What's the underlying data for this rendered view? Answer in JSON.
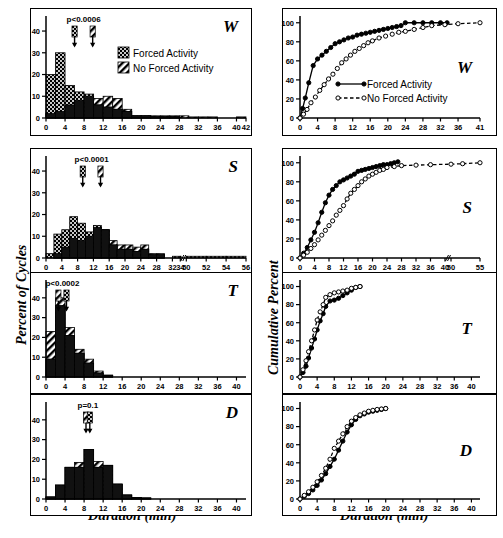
{
  "figure": {
    "xlabel": "Duration (min)",
    "ylabel_left": "Percent of Cycles",
    "ylabel_right": "Cumulative Percent",
    "legend_hist": [
      {
        "key": "forced",
        "label": "Forced Activity",
        "pattern": "checker-dark"
      },
      {
        "key": "no_forced",
        "label": "No Forced Activity",
        "pattern": "hatch-diagonal"
      }
    ],
    "legend_cumulative": [
      {
        "key": "forced",
        "label": "Forced Activity",
        "marker": "filled-circle",
        "line": "solid"
      },
      {
        "key": "no_forced",
        "label": "No Forced Activity",
        "marker": "open-circle",
        "line": "dashed"
      }
    ]
  },
  "chart_data": [
    {
      "id": "hist-W",
      "type": "bar",
      "panel_letter": "W",
      "title": "",
      "xlabel": "Duration (min)",
      "ylabel": "Percent of Cycles",
      "annotation": "p<0.0006",
      "arrows": [
        {
          "series": "forced",
          "x": 6.0
        },
        {
          "series": "no_forced",
          "x": 9.8
        }
      ],
      "xlim": [
        0,
        42
      ],
      "ylim": [
        0,
        46
      ],
      "xticks": [
        0,
        4,
        8,
        12,
        16,
        20,
        24,
        28,
        32,
        36,
        40,
        42
      ],
      "yticks": [
        0,
        10,
        20,
        30,
        40
      ],
      "bin_width": 2,
      "bin_starts": [
        0,
        2,
        4,
        6,
        8,
        10,
        12,
        14,
        16,
        18,
        20,
        22,
        24,
        26,
        28,
        30,
        32,
        34,
        36,
        38,
        40
      ],
      "series": [
        {
          "name": "Forced Activity",
          "values": [
            20,
            30,
            15,
            12,
            11,
            6,
            5,
            4,
            3,
            1,
            1,
            0.6,
            0.6,
            0.6,
            0,
            0,
            0,
            0,
            0,
            0,
            0
          ]
        },
        {
          "name": "No Forced Activity",
          "values": [
            2,
            3,
            6,
            8,
            10,
            9,
            10,
            9,
            4,
            1,
            1,
            1,
            1,
            1,
            1,
            0.5,
            0.5,
            0.5,
            0,
            0,
            0.5
          ]
        }
      ]
    },
    {
      "id": "hist-S",
      "type": "bar",
      "panel_letter": "S",
      "xlabel": "Duration (min)",
      "ylabel": "Percent of Cycles",
      "annotation": "p<0.0001",
      "arrows": [
        {
          "series": "forced",
          "x": 9.3
        },
        {
          "series": "no_forced",
          "x": 13.8
        }
      ],
      "xlim": [
        0,
        56
      ],
      "ylim": [
        0,
        46
      ],
      "xticks": [
        0,
        4,
        8,
        12,
        16,
        20,
        24,
        28,
        32,
        34,
        50,
        52,
        54,
        56
      ],
      "axis_break_after": 34,
      "yticks": [
        0,
        10,
        20,
        30,
        40
      ],
      "bin_width": 2,
      "bin_starts": [
        0,
        2,
        4,
        6,
        8,
        10,
        12,
        14,
        16,
        18,
        20,
        22,
        24,
        26,
        28,
        30,
        32,
        34,
        50,
        52,
        54
      ],
      "series": [
        {
          "name": "Forced Activity",
          "values": [
            2,
            11,
            13,
            19,
            16,
            12,
            15,
            13,
            6,
            4,
            4,
            3,
            4,
            1.5,
            1.5,
            0,
            0.8,
            0.8,
            0.8,
            0.8,
            0.8
          ]
        },
        {
          "name": "No Forced Activity",
          "values": [
            0,
            2,
            5,
            9,
            8,
            10,
            14,
            13,
            8,
            6,
            6,
            5,
            6,
            2,
            2,
            0,
            0,
            0,
            0,
            0,
            0
          ]
        }
      ]
    },
    {
      "id": "hist-T",
      "type": "bar",
      "panel_letter": "T",
      "xlabel": "Duration (min)",
      "ylabel": "Percent of Cycles",
      "annotation": "p<0.0002",
      "arrows": [
        {
          "series": "no_forced",
          "x": 2.6
        },
        {
          "series": "forced",
          "x": 4.3
        }
      ],
      "xlim": [
        0,
        42
      ],
      "ylim": [
        0,
        48
      ],
      "xticks": [
        0,
        4,
        8,
        12,
        16,
        20,
        24,
        28,
        32,
        36,
        40
      ],
      "yticks": [
        0,
        10,
        20,
        30,
        40
      ],
      "bin_width": 2,
      "bin_starts": [
        0,
        2,
        4,
        6,
        8,
        10,
        12,
        14,
        16,
        18,
        20
      ],
      "series": [
        {
          "name": "Forced Activity",
          "values": [
            9,
            36,
            21,
            12,
            7,
            2,
            0.8,
            0,
            0,
            0,
            0
          ]
        },
        {
          "name": "No Forced Activity",
          "values": [
            23,
            40,
            25,
            14,
            9,
            3,
            1,
            0,
            0,
            0,
            0
          ]
        }
      ]
    },
    {
      "id": "hist-D",
      "type": "bar",
      "panel_letter": "D",
      "xlabel": "Duration (min)",
      "ylabel": "Percent of Cycles",
      "annotation": "p=0.1",
      "arrows": [
        {
          "series": "no_forced",
          "x": 8.4
        },
        {
          "series": "forced",
          "x": 9.2
        }
      ],
      "xlim": [
        0,
        42
      ],
      "ylim": [
        0,
        48
      ],
      "xticks": [
        0,
        4,
        8,
        12,
        16,
        20,
        24,
        28,
        32,
        36,
        40
      ],
      "yticks": [
        0,
        10,
        20,
        30,
        40
      ],
      "bin_width": 2,
      "bin_starts": [
        0,
        2,
        4,
        6,
        8,
        10,
        12,
        14,
        16,
        18,
        20,
        22
      ],
      "series": [
        {
          "name": "Forced Activity",
          "values": [
            1,
            7,
            16,
            16,
            25,
            16,
            17,
            7.5,
            2,
            0.8,
            0.5,
            0
          ]
        },
        {
          "name": "No Forced Activity",
          "values": [
            1,
            7,
            16,
            18.5,
            25,
            19,
            17,
            7.5,
            2,
            0.8,
            0.5,
            0
          ]
        }
      ]
    },
    {
      "id": "cum-W",
      "type": "line",
      "panel_letter": "W",
      "xlabel": "Duration (min)",
      "ylabel": "Cumulative Percent",
      "xlim": [
        0,
        41
      ],
      "ylim": [
        0,
        105
      ],
      "xticks": [
        0,
        4,
        8,
        12,
        16,
        20,
        24,
        28,
        32,
        36,
        41
      ],
      "yticks": [
        0,
        20,
        40,
        60,
        80,
        100
      ],
      "series": [
        {
          "name": "Forced Activity",
          "marker": "filled-circle",
          "line": "solid",
          "x": [
            0,
            0.6,
            1.2,
            2,
            3,
            4,
            5,
            6,
            7,
            8,
            9,
            10,
            11,
            12,
            13,
            14,
            15,
            16,
            17,
            18,
            19,
            20,
            21,
            22,
            23,
            24,
            26,
            28,
            30,
            32,
            33.5
          ],
          "y": [
            0,
            10,
            21,
            37,
            55,
            62,
            66,
            70,
            74,
            78,
            80,
            82,
            84,
            85,
            87,
            88,
            89,
            90,
            91,
            92,
            93,
            94,
            95,
            96,
            97,
            100,
            100,
            100,
            100,
            100,
            100
          ]
        },
        {
          "name": "No Forced Activity",
          "marker": "open-circle",
          "line": "dashed",
          "x": [
            0,
            0.8,
            1.6,
            2.5,
            3.5,
            4.5,
            5.5,
            6.5,
            7.5,
            8.5,
            9.5,
            10.5,
            11.5,
            12.5,
            13.5,
            14.5,
            15.5,
            16.5,
            18,
            19.5,
            21,
            22.5,
            24,
            26,
            28,
            30,
            33,
            36,
            41
          ],
          "y": [
            0,
            4,
            9,
            16,
            22,
            29,
            35,
            41,
            46,
            52,
            58,
            62,
            66,
            70,
            73,
            76,
            79,
            81,
            84,
            86,
            88,
            90,
            91,
            93,
            95,
            97,
            98,
            99,
            100
          ]
        }
      ]
    },
    {
      "id": "cum-S",
      "type": "line",
      "panel_letter": "S",
      "xlabel": "Duration (min)",
      "ylabel": "Cumulative Percent",
      "xlim": [
        0,
        56
      ],
      "ylim": [
        0,
        105
      ],
      "xticks": [
        0,
        4,
        8,
        12,
        16,
        20,
        24,
        28,
        32,
        36,
        40,
        50,
        55
      ],
      "axis_break_after": 40,
      "yticks": [
        0,
        20,
        40,
        60,
        80,
        100
      ],
      "series": [
        {
          "name": "Forced Activity",
          "marker": "filled-circle",
          "line": "solid",
          "x": [
            0,
            1,
            2,
            3,
            4,
            5,
            6,
            7,
            8,
            9,
            10,
            11,
            12,
            13,
            14,
            15,
            16,
            17,
            18,
            19,
            20,
            21,
            22,
            23,
            24,
            25,
            26,
            27
          ],
          "y": [
            0,
            5,
            11,
            19,
            27,
            37,
            48,
            58,
            66,
            72,
            76,
            80,
            82,
            84,
            86,
            88,
            91,
            92,
            93,
            94,
            95,
            96,
            97,
            98,
            98,
            99,
            100,
            101
          ]
        },
        {
          "name": "No Forced Activity",
          "marker": "open-circle",
          "line": "dashed",
          "x": [
            0,
            1,
            2,
            3,
            4,
            5,
            6,
            7,
            8,
            9,
            10,
            11,
            12,
            13,
            14,
            15,
            16,
            17,
            18,
            19,
            20,
            21,
            22,
            23,
            24,
            26,
            28,
            32,
            36,
            50,
            52,
            55
          ],
          "y": [
            0,
            3,
            6,
            10,
            14,
            19,
            24,
            29,
            34,
            39,
            45,
            50,
            55,
            62,
            68,
            72,
            76,
            80,
            83,
            86,
            88,
            90,
            92,
            93,
            95,
            96,
            97,
            97.5,
            98,
            98.5,
            99,
            100
          ]
        }
      ]
    },
    {
      "id": "cum-T",
      "type": "line",
      "panel_letter": "T",
      "xlabel": "Duration (min)",
      "ylabel": "Cumulative Percent",
      "xlim": [
        0,
        42
      ],
      "ylim": [
        0,
        105
      ],
      "xticks": [
        0,
        4,
        8,
        12,
        16,
        20,
        24,
        28,
        32,
        36,
        40
      ],
      "yticks": [
        0,
        20,
        40,
        60,
        80,
        100
      ],
      "series": [
        {
          "name": "Forced Activity",
          "marker": "filled-circle",
          "line": "solid",
          "x": [
            0,
            0.7,
            1.4,
            2,
            2.7,
            3.4,
            4,
            4.7,
            5.4,
            6,
            7,
            8,
            9,
            10,
            11,
            12,
            13,
            14
          ],
          "y": [
            0,
            5,
            12,
            21,
            32,
            42,
            52,
            62,
            70,
            78,
            84,
            85,
            87,
            90,
            93,
            96,
            99,
            100
          ]
        },
        {
          "name": "No Forced Activity",
          "marker": "open-circle",
          "line": "dashed",
          "x": [
            0,
            0.7,
            1.4,
            2,
            2.7,
            3.4,
            4,
            4.7,
            5.4,
            6,
            7,
            8,
            9,
            10,
            11,
            12,
            13,
            14
          ],
          "y": [
            0,
            8,
            18,
            28,
            40,
            52,
            63,
            72,
            80,
            88,
            91,
            93,
            94,
            95,
            96,
            98,
            99,
            100
          ]
        }
      ]
    },
    {
      "id": "cum-D",
      "type": "line",
      "panel_letter": "D",
      "xlabel": "Duration (min)",
      "ylabel": "Cumulative Percent",
      "xlim": [
        0,
        42
      ],
      "ylim": [
        0,
        105
      ],
      "xticks": [
        0,
        4,
        8,
        12,
        16,
        20,
        24,
        28,
        32,
        36,
        40
      ],
      "yticks": [
        0,
        20,
        40,
        60,
        80,
        100
      ],
      "series": [
        {
          "name": "Forced Activity",
          "marker": "filled-circle",
          "line": "solid",
          "x": [
            0,
            1,
            2,
            3,
            4,
            5,
            6,
            7,
            8,
            9,
            10,
            11,
            12,
            13,
            14,
            15,
            16,
            17,
            18,
            19,
            20
          ],
          "y": [
            0,
            3,
            6,
            10,
            15,
            21,
            28,
            36,
            44,
            54,
            64,
            74,
            82,
            88,
            92,
            94,
            96,
            97,
            98,
            99,
            100
          ]
        },
        {
          "name": "No Forced Activity",
          "marker": "open-circle",
          "line": "dashed",
          "x": [
            0,
            1,
            2,
            3,
            4,
            5,
            6,
            7,
            8,
            9,
            10,
            11,
            12,
            13,
            14,
            15,
            16,
            17,
            18,
            19,
            20
          ],
          "y": [
            0,
            4,
            8,
            13,
            19,
            26,
            34,
            44,
            56,
            64,
            72,
            80,
            86,
            90,
            93,
            95,
            97,
            98,
            99,
            99.5,
            100
          ]
        }
      ]
    }
  ]
}
